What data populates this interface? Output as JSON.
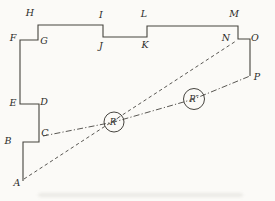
{
  "figure": {
    "background": "#fbfaf7",
    "stroke_color": "#46443f",
    "label_color": "#2b2b28",
    "outline_points": [
      [
        23,
        181
      ],
      [
        23,
        142
      ],
      [
        39,
        142
      ],
      [
        39,
        104
      ],
      [
        20,
        104
      ],
      [
        20,
        40
      ],
      [
        38,
        40
      ],
      [
        38,
        25
      ],
      [
        103,
        25
      ],
      [
        103,
        37
      ],
      [
        147,
        37
      ],
      [
        147,
        26
      ],
      [
        238,
        26
      ],
      [
        238,
        39
      ],
      [
        250,
        39
      ],
      [
        250,
        76
      ]
    ],
    "dashed_line": {
      "name": "sight-line-A-N",
      "from": [
        24,
        179
      ],
      "to": [
        236,
        41
      ]
    },
    "dashdot_line": {
      "name": "sight-line-C-P",
      "points": [
        [
          43,
          136
        ],
        [
          114,
          122
        ],
        [
          194,
          99
        ],
        [
          250,
          76
        ]
      ]
    },
    "vertex_labels": [
      {
        "text": "A",
        "x": 17,
        "y": 183
      },
      {
        "text": "B",
        "x": 8,
        "y": 141
      },
      {
        "text": "C",
        "x": 45,
        "y": 133
      },
      {
        "text": "D",
        "x": 44,
        "y": 102
      },
      {
        "text": "E",
        "x": 13,
        "y": 103
      },
      {
        "text": "F",
        "x": 13,
        "y": 38
      },
      {
        "text": "G",
        "x": 44,
        "y": 41
      },
      {
        "text": "H",
        "x": 30,
        "y": 13
      },
      {
        "text": "I",
        "x": 101,
        "y": 15
      },
      {
        "text": "J",
        "x": 101,
        "y": 46
      },
      {
        "text": "K",
        "x": 145,
        "y": 45
      },
      {
        "text": "L",
        "x": 144,
        "y": 14
      },
      {
        "text": "M",
        "x": 234,
        "y": 14
      },
      {
        "text": "N",
        "x": 226,
        "y": 38
      },
      {
        "text": "O",
        "x": 255,
        "y": 38
      },
      {
        "text": "P",
        "x": 257,
        "y": 77
      }
    ],
    "circle_markers": [
      {
        "label": "R′",
        "x": 114,
        "y": 122,
        "r": 10
      },
      {
        "label": "R″",
        "x": 194,
        "y": 99,
        "r": 10.5
      }
    ]
  }
}
